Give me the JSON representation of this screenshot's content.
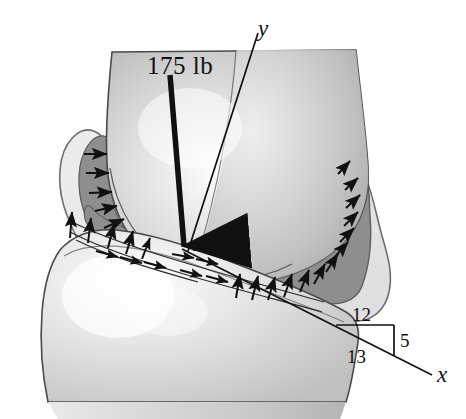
{
  "figure": {
    "kind": "knee-joint-free-body-diagram",
    "background_color": "#ffffff",
    "labels": {
      "load": "175 lb",
      "point": "A",
      "axis_y": "y",
      "axis_x": "x",
      "slope_run": "12",
      "slope_rise": "5",
      "slope_hyp": "13"
    },
    "colors": {
      "ink": "#111111",
      "bone_light": "#dcdcdc",
      "bone_mid": "#c6c6c6",
      "bone_dark": "#ababab",
      "cartilage_dark": "#8e8e8e",
      "capsule_light": "#e8e8e8",
      "outline": "#3a3a3a",
      "highlight": "#f8f8f8"
    },
    "geometry": {
      "load_arrow": {
        "x1": 170,
        "y1": 75,
        "x2": 185,
        "y2": 252
      },
      "axis_y": {
        "x1": 188,
        "y1": 251,
        "x2": 258,
        "y2": 33
      },
      "axis_x": {
        "x1": 183,
        "y1": 250,
        "x2": 432,
        "y2": 375
      },
      "slope_triangle": {
        "run": 12,
        "rise": 5,
        "hyp": 13
      }
    },
    "arrow_count": 30
  }
}
